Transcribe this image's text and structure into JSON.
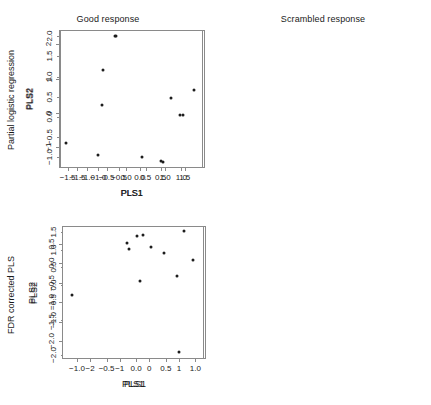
{
  "figure": {
    "row_labels": [
      {
        "id": "partial-logistic-regression",
        "text": "Partial logistic regression"
      },
      {
        "id": "fdr-corrected-pls",
        "text": "FDR corrected PLS"
      }
    ],
    "column_titles": [
      "Good response",
      "Scrambled response"
    ],
    "point_color": "#1d1d1d",
    "frame_color": "#8a8a8a"
  },
  "chart_data": [
    {
      "id": "top-left",
      "type": "scatter",
      "title": "Good response",
      "row_label": "Partial logistic regression",
      "xlabel": "PLS1",
      "ylabel": "PLS2",
      "xlim": [
        -1.72,
        2.02
      ],
      "ylim": [
        -1.62,
        2.42
      ],
      "xticks": [
        -1.5,
        -1.0,
        -0.5,
        0.0,
        0.5,
        1.0,
        1.5
      ],
      "yticks": [
        -1,
        0,
        1,
        2
      ],
      "xticklabels": [
        "-1.5",
        "-1.0",
        "-0.5",
        "0.0",
        "0.5",
        "1.0",
        "1.5"
      ],
      "yticklabels": [
        "-1",
        "0",
        "1",
        "2"
      ],
      "grid": false,
      "legend": null,
      "x": [
        -1.45,
        -1.08,
        -1.06,
        -0.65,
        -0.32,
        -0.31,
        0.11,
        0.37,
        0.69,
        0.84,
        1.1,
        1.87
      ],
      "y": [
        0.37,
        0.0,
        0.18,
        -0.64,
        -0.96,
        -1.52,
        2.27,
        0.92,
        -0.06,
        -0.23,
        0.36,
        -0.72
      ]
    },
    {
      "id": "top-right",
      "type": "scatter",
      "title": "Scrambled response",
      "row_label": "Partial logistic regression",
      "xlabel": "PLS1",
      "ylabel": "PLS2",
      "xlim": [
        -1.92,
        1.52
      ],
      "ylim": [
        -1.28,
        2.16
      ],
      "xticks": [
        -1.5,
        -1.0,
        -0.5,
        0.0,
        0.5,
        1.0
      ],
      "yticks": [
        -1.0,
        -0.5,
        0.0,
        0.5,
        1.0,
        1.5,
        2.0
      ],
      "xticklabels": [
        "-1.5",
        "-1.0",
        "-0.5",
        "0.0",
        "0.5",
        "1.0"
      ],
      "yticklabels": [
        "-1.0",
        "-0.5",
        "0.0",
        "0.5",
        "1.0",
        "1.5",
        "2.0"
      ],
      "grid": false,
      "legend": null,
      "x": [
        -1.78,
        -1.0,
        -0.9,
        -0.88,
        -0.6,
        -0.58,
        0.05,
        0.5,
        0.56,
        0.76,
        0.97,
        1.05,
        1.3
      ],
      "y": [
        -0.65,
        -0.96,
        0.29,
        1.17,
        2.0,
        2.0,
        -1.0,
        -1.1,
        -1.14,
        0.47,
        0.03,
        0.05,
        0.67
      ]
    },
    {
      "id": "bottom-left",
      "type": "scatter",
      "title": "",
      "row_label": "FDR corrected PLS",
      "xlabel": "PLS1",
      "ylabel": "PLS2",
      "xlim": [
        -1.22,
        1.18
      ],
      "ylim": [
        -2.12,
        1.68
      ],
      "xticks": [
        -1.0,
        -0.5,
        0.0,
        0.5,
        1.0
      ],
      "yticks": [
        -2.0,
        -1.0,
        -0.5,
        0.0,
        0.5,
        1.0,
        1.5
      ],
      "xticklabels": [
        "-1.0",
        "-0.5",
        "0.0",
        "0.5",
        "1.0"
      ],
      "yticklabels": [
        "-2.0",
        "-1.0",
        "-0.5",
        "0.0",
        "0.5",
        "1.0",
        "1.5"
      ],
      "grid": false,
      "legend": null,
      "x": [
        -1.09,
        -0.99,
        -0.97,
        -0.96,
        -0.94,
        -0.72,
        0.8,
        0.88,
        0.95,
        0.97,
        1.01,
        1.05
      ],
      "y": [
        -0.16,
        1.44,
        -0.28,
        -1.05,
        0.93,
        -0.32,
        0.19,
        0.27,
        -0.12,
        1.55,
        -1.95,
        0.03
      ]
    },
    {
      "id": "bottom-right",
      "type": "scatter",
      "title": "",
      "row_label": "FDR corrected PLS",
      "xlabel": "PLS1",
      "ylabel": "PLS2",
      "xlim": [
        -2.95,
        1.85
      ],
      "ylim": [
        -2.45,
        0.95
      ],
      "xticks": [
        -2,
        -1,
        0,
        1
      ],
      "yticks": [
        -2.0,
        -1.5,
        -1.0,
        -0.5,
        0.0,
        0.5
      ],
      "xticklabels": [
        "-2",
        "-1",
        "0",
        "1"
      ],
      "yticklabels": [
        "-2.0",
        "-1.5",
        "-1.0",
        "-0.5",
        "0.0",
        "0.5"
      ],
      "grid": false,
      "legend": null,
      "x": [
        -2.6,
        -0.75,
        -0.67,
        -0.42,
        -0.3,
        -0.22,
        0.05,
        0.5,
        0.95,
        1.0,
        1.18,
        1.48
      ],
      "y": [
        -0.82,
        0.52,
        0.36,
        0.7,
        -0.46,
        0.72,
        0.41,
        0.26,
        -0.33,
        -2.27,
        0.81,
        0.08
      ]
    }
  ]
}
